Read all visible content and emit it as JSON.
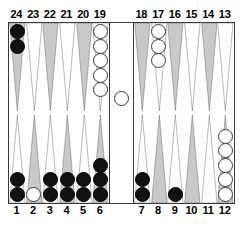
{
  "figure": {
    "name": "backgammon-board",
    "background_color": "#ffffff",
    "frame_color": "#3a3a3a"
  },
  "colors": {
    "point_light": "#ffffff",
    "point_dark": "#c9c9c9",
    "point_outline": "#555555",
    "checker_black": "#111111",
    "checker_white": "#ffffff",
    "checker_white_outline": "#3a3a3a",
    "label_color": "#000000"
  },
  "labels": {
    "top": [
      "24",
      "23",
      "22",
      "21",
      "20",
      "19",
      "18",
      "17",
      "16",
      "15",
      "14",
      "13"
    ],
    "bottom": [
      "1",
      "2",
      "3",
      "4",
      "5",
      "6",
      "7",
      "8",
      "9",
      "10",
      "11",
      "12"
    ]
  },
  "chart_data": {
    "type": "diagram",
    "title": "",
    "xlabel": "",
    "ylabel": "",
    "legend": [
      {
        "name": "black",
        "color": "#111111"
      },
      {
        "name": "white",
        "color": "#ffffff"
      }
    ],
    "points": [
      {
        "point": 24,
        "row": "top",
        "quadrant": "top-left",
        "shade": "dark",
        "color": "black",
        "count": 2
      },
      {
        "point": 23,
        "row": "top",
        "quadrant": "top-left",
        "shade": "light",
        "color": null,
        "count": 0
      },
      {
        "point": 22,
        "row": "top",
        "quadrant": "top-left",
        "shade": "dark",
        "color": null,
        "count": 0
      },
      {
        "point": 21,
        "row": "top",
        "quadrant": "top-left",
        "shade": "light",
        "color": null,
        "count": 0
      },
      {
        "point": 20,
        "row": "top",
        "quadrant": "top-left",
        "shade": "dark",
        "color": null,
        "count": 0
      },
      {
        "point": 19,
        "row": "top",
        "quadrant": "top-left",
        "shade": "light",
        "color": "white",
        "count": 5
      },
      {
        "point": 18,
        "row": "top",
        "quadrant": "top-right",
        "shade": "dark",
        "color": null,
        "count": 0
      },
      {
        "point": 17,
        "row": "top",
        "quadrant": "top-right",
        "shade": "light",
        "color": "white",
        "count": 3
      },
      {
        "point": 16,
        "row": "top",
        "quadrant": "top-right",
        "shade": "dark",
        "color": null,
        "count": 0
      },
      {
        "point": 15,
        "row": "top",
        "quadrant": "top-right",
        "shade": "light",
        "color": null,
        "count": 0
      },
      {
        "point": 14,
        "row": "top",
        "quadrant": "top-right",
        "shade": "dark",
        "color": null,
        "count": 0
      },
      {
        "point": 13,
        "row": "top",
        "quadrant": "top-right",
        "shade": "light",
        "color": null,
        "count": 0
      },
      {
        "point": 1,
        "row": "bottom",
        "quadrant": "bottom-left",
        "shade": "light",
        "color": "black",
        "count": 2
      },
      {
        "point": 2,
        "row": "bottom",
        "quadrant": "bottom-left",
        "shade": "dark",
        "color": "white",
        "count": 1
      },
      {
        "point": 3,
        "row": "bottom",
        "quadrant": "bottom-left",
        "shade": "light",
        "color": "black",
        "count": 2
      },
      {
        "point": 4,
        "row": "bottom",
        "quadrant": "bottom-left",
        "shade": "dark",
        "color": "black",
        "count": 2
      },
      {
        "point": 5,
        "row": "bottom",
        "quadrant": "bottom-left",
        "shade": "light",
        "color": "black",
        "count": 2
      },
      {
        "point": 6,
        "row": "bottom",
        "quadrant": "bottom-left",
        "shade": "dark",
        "color": "black",
        "count": 3
      },
      {
        "point": 7,
        "row": "bottom",
        "quadrant": "bottom-right",
        "shade": "light",
        "color": "black",
        "count": 2
      },
      {
        "point": 8,
        "row": "bottom",
        "quadrant": "bottom-right",
        "shade": "dark",
        "color": null,
        "count": 0
      },
      {
        "point": 9,
        "row": "bottom",
        "quadrant": "bottom-right",
        "shade": "light",
        "color": "black",
        "count": 1
      },
      {
        "point": 10,
        "row": "bottom",
        "quadrant": "bottom-right",
        "shade": "dark",
        "color": null,
        "count": 0
      },
      {
        "point": 11,
        "row": "bottom",
        "quadrant": "bottom-right",
        "shade": "light",
        "color": null,
        "count": 0
      },
      {
        "point": 12,
        "row": "bottom",
        "quadrant": "bottom-right",
        "shade": "dark",
        "color": "white",
        "count": 5
      }
    ],
    "bar": [
      {
        "color": "white",
        "count": 1
      }
    ],
    "totals": {
      "black_on_board": 14,
      "white_on_board": 14,
      "white_on_bar": 1
    }
  }
}
